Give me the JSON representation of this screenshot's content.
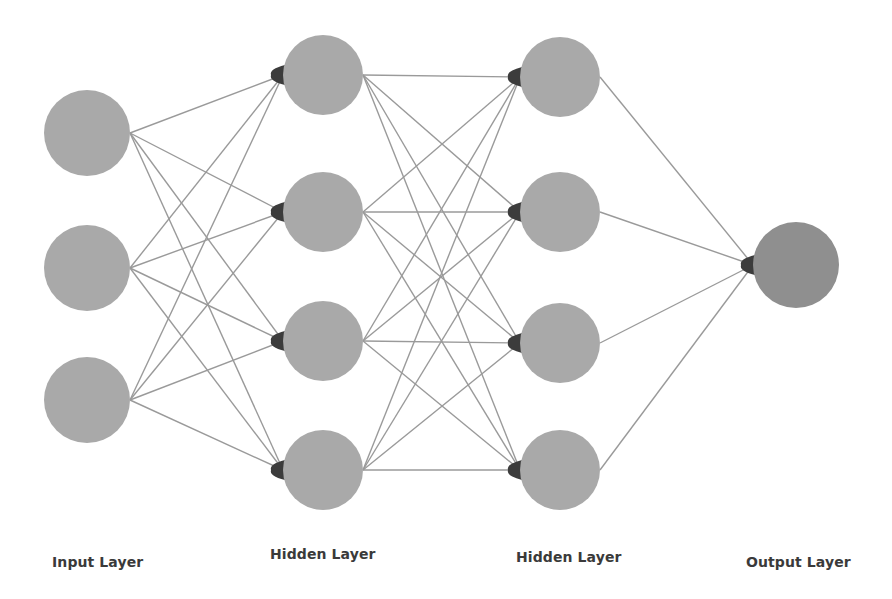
{
  "diagram": {
    "type": "neural-network",
    "colors": {
      "node": "#a9a9a9",
      "output_node": "#8f8f8f",
      "edge": "#9a9a9a",
      "arrowhead": "#3c3c3c",
      "label": "#3a3a3a"
    },
    "layers": [
      {
        "id": "input",
        "label": "Input Layer",
        "label_x": 52,
        "label_y": 568,
        "x": 87,
        "r": 43,
        "nodes": [
          133,
          268,
          400
        ]
      },
      {
        "id": "hidden1",
        "label": "Hidden Layer",
        "label_x": 270,
        "label_y": 560,
        "x": 323,
        "r": 40,
        "nodes": [
          75,
          212,
          341,
          470
        ]
      },
      {
        "id": "hidden2",
        "label": "Hidden Layer",
        "label_x": 516,
        "label_y": 563,
        "x": 560,
        "r": 40,
        "nodes": [
          77,
          212,
          343,
          470
        ]
      },
      {
        "id": "output",
        "label": "Output Layer",
        "label_x": 746,
        "label_y": 568,
        "x": 796,
        "r": 43,
        "nodes": [
          265
        ]
      }
    ]
  }
}
